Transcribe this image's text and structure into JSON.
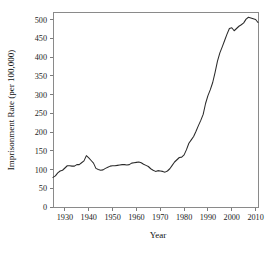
{
  "chart_data": {
    "type": "line",
    "title": "",
    "xlabel": "Year",
    "ylabel": "Imprisonment Rate (per 100,000)",
    "xlim": [
      1925,
      2011
    ],
    "ylim": [
      0,
      520
    ],
    "grid": false,
    "legend": "none",
    "x_ticks": [
      1930,
      1940,
      1950,
      1960,
      1970,
      1980,
      1990,
      2000,
      2010
    ],
    "x_tick_labels": [
      "1930",
      "1940",
      "1950",
      "1960",
      "1970",
      "1980",
      "1990",
      "2000",
      "2010"
    ],
    "y_ticks": [
      0,
      50,
      100,
      150,
      200,
      250,
      300,
      350,
      400,
      450,
      500
    ],
    "y_tick_labels": [
      "0",
      "50",
      "100",
      "150",
      "200",
      "250",
      "300",
      "350",
      "400",
      "450",
      "500"
    ],
    "line_color": "#2b2b2b",
    "series": [
      {
        "name": "Imprisonment Rate",
        "x": [
          1925,
          1926,
          1927,
          1928,
          1929,
          1930,
          1931,
          1932,
          1933,
          1934,
          1935,
          1936,
          1937,
          1938,
          1939,
          1940,
          1941,
          1942,
          1943,
          1944,
          1945,
          1946,
          1947,
          1948,
          1949,
          1950,
          1951,
          1952,
          1953,
          1954,
          1955,
          1956,
          1957,
          1958,
          1959,
          1960,
          1961,
          1962,
          1963,
          1964,
          1965,
          1966,
          1967,
          1968,
          1969,
          1970,
          1971,
          1972,
          1973,
          1974,
          1975,
          1976,
          1977,
          1978,
          1979,
          1980,
          1981,
          1982,
          1983,
          1984,
          1985,
          1986,
          1987,
          1988,
          1989,
          1990,
          1991,
          1992,
          1993,
          1994,
          1995,
          1996,
          1997,
          1998,
          1999,
          2000,
          2001,
          2002,
          2003,
          2004,
          2005,
          2006,
          2007,
          2008,
          2009,
          2010,
          2011
        ],
        "values": [
          79,
          83,
          91,
          96,
          98,
          104,
          110,
          110,
          109,
          109,
          113,
          113,
          118,
          123,
          137,
          131,
          124,
          117,
          103,
          100,
          98,
          99,
          103,
          106,
          109,
          110,
          110,
          111,
          112,
          113,
          113,
          112,
          113,
          117,
          118,
          119,
          120,
          118,
          114,
          111,
          108,
          102,
          98,
          95,
          97,
          96,
          95,
          93,
          96,
          102,
          111,
          120,
          126,
          132,
          133,
          139,
          153,
          170,
          179,
          188,
          202,
          217,
          231,
          247,
          276,
          297,
          313,
          332,
          359,
          389,
          411,
          427,
          444,
          461,
          476,
          478,
          470,
          476,
          482,
          486,
          491,
          501,
          506,
          504,
          502,
          500,
          492
        ]
      }
    ]
  }
}
